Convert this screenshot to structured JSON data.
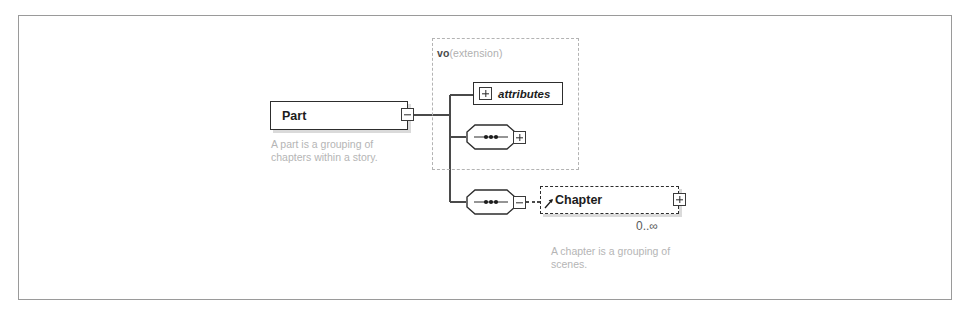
{
  "diagram": {
    "type": "xml-schema-element-diagram",
    "frame_border_color": "#9a9a9a",
    "background": "#ffffff"
  },
  "extension": {
    "prefix": "vo",
    "kind": "(extension)",
    "border_style": "dashed",
    "border_color": "#b3b3b3"
  },
  "elements": {
    "part": {
      "name": "Part",
      "toggle": "minus",
      "toggle_icon": "collapse-minus-icon",
      "border_style": "solid",
      "annotation": "A part is a grouping of\nchapters within a story."
    },
    "chapter": {
      "name": "Chapter",
      "toggle": "plus",
      "toggle_icon": "expand-plus-icon",
      "border_style": "dashed",
      "cardinality": "0..∞",
      "annotation": "A chapter is a grouping of\nscenes.",
      "reference_icon": "reference-arrow-icon"
    }
  },
  "attributes_node": {
    "label": "attributes",
    "toggle": "plus",
    "toggle_icon": "expand-plus-icon"
  },
  "compositors": [
    {
      "name": "sequence-1",
      "kind": "sequence",
      "icon": "sequence-icon",
      "toggle": "plus",
      "toggle_icon": "expand-plus-icon",
      "inside_extension": true
    },
    {
      "name": "sequence-2",
      "kind": "sequence",
      "icon": "sequence-icon",
      "toggle": "minus",
      "toggle_icon": "collapse-minus-icon",
      "inside_extension": false
    }
  ]
}
